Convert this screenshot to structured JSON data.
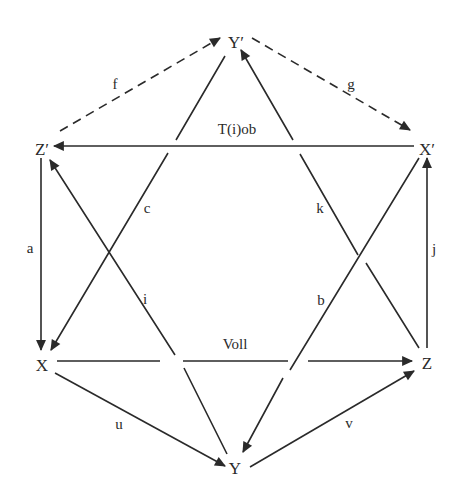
{
  "diagram": {
    "type": "directed-graph",
    "background": "#ffffff",
    "stroke_color": "#2a2a2a",
    "nodes": [
      {
        "id": "Yp",
        "label": "Y′",
        "x": 236,
        "y": 42
      },
      {
        "id": "Zp",
        "label": "Z′",
        "x": 42,
        "y": 149
      },
      {
        "id": "Xp",
        "label": "X′",
        "x": 427,
        "y": 149
      },
      {
        "id": "X",
        "label": "X",
        "x": 42,
        "y": 365
      },
      {
        "id": "Z",
        "label": "Z",
        "x": 427,
        "y": 363
      },
      {
        "id": "Y",
        "label": "Y",
        "x": 235,
        "y": 466
      }
    ],
    "edges": [
      {
        "id": "f",
        "label": "f",
        "from": "Zp",
        "to": "Yp",
        "style": "dashed"
      },
      {
        "id": "g",
        "label": "g",
        "from": "Yp",
        "to": "Xp",
        "style": "dashed"
      },
      {
        "id": "tiob",
        "label": "T(i)ob",
        "from": "Xp",
        "to": "Zp",
        "style": "solid"
      },
      {
        "id": "a",
        "label": "a",
        "from": "Zp",
        "to": "X",
        "style": "solid"
      },
      {
        "id": "c",
        "label": "c",
        "from": "Yp",
        "to": "X",
        "style": "solid"
      },
      {
        "id": "i",
        "label": "i",
        "from": "Y",
        "to": "Zp",
        "style": "solid"
      },
      {
        "id": "k",
        "label": "k",
        "from": "Z",
        "to": "Yp",
        "style": "solid"
      },
      {
        "id": "b",
        "label": "b",
        "from": "Xp",
        "to": "Y",
        "style": "solid"
      },
      {
        "id": "j",
        "label": "j",
        "from": "Z",
        "to": "Xp",
        "style": "solid"
      },
      {
        "id": "voll",
        "label": "Voll",
        "from": "X",
        "to": "Z",
        "style": "solid"
      },
      {
        "id": "u",
        "label": "u",
        "from": "X",
        "to": "Y",
        "style": "solid"
      },
      {
        "id": "v",
        "label": "v",
        "from": "Y",
        "to": "Z",
        "style": "solid"
      }
    ]
  },
  "labels": {
    "node_Yp": "Y′",
    "node_Zp": "Z′",
    "node_Xp": "X′",
    "node_X": "X",
    "node_Z": "Z",
    "node_Y": "Y",
    "edge_f": "f",
    "edge_g": "g",
    "edge_tiob": "T(i)ob",
    "edge_a": "a",
    "edge_c": "c",
    "edge_i": "i",
    "edge_k": "k",
    "edge_b": "b",
    "edge_j": "j",
    "edge_voll": "Voll",
    "edge_u": "u",
    "edge_v": "v"
  }
}
